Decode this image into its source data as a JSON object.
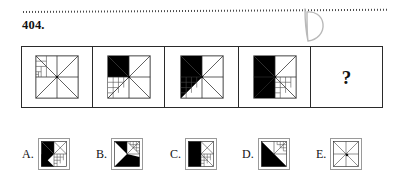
{
  "page": {
    "question_number": "404.",
    "handwritten_answer": "D",
    "divider": "dotted-rule"
  },
  "stimulus": {
    "name": "matrix-sequence",
    "cells": [
      {
        "id": "cell-1",
        "position": 1,
        "filled_sectors": [],
        "fractal_quadrant": "upper-left",
        "description": "square with full X diagonals and center cross, nested recursive grid in upper-left quadrant, no black fill"
      },
      {
        "id": "cell-2",
        "position": 2,
        "filled_sectors": [
          "upper-left-upper",
          "upper-left-lower"
        ],
        "fractal_quadrant": "lower-left",
        "description": "upper-left quadrant filled black as triangle, nested recursive grid in lower-left quadrant"
      },
      {
        "id": "cell-3",
        "position": 3,
        "filled_sectors": [
          "upper-left",
          "lower-left-upper"
        ],
        "fractal_quadrant": "lower-left",
        "description": "left half filled black forming bow-tie triangle, nested recursive grid in lower-left quadrant"
      },
      {
        "id": "cell-4",
        "position": 4,
        "filled_sectors": [
          "upper-left",
          "lower-left"
        ],
        "fractal_quadrant": "lower-right",
        "description": "large black triangle covering upper-left through lower-left, nested recursive grid in lower-right quadrant"
      },
      {
        "id": "cell-5",
        "position": 5,
        "content": "?",
        "description": "unknown answer cell containing a question mark"
      }
    ]
  },
  "options": [
    {
      "id": "option-a",
      "label": "A.",
      "description": "black triangle occupying upper-left, nested recursive grid in lower-right"
    },
    {
      "id": "option-b",
      "label": "B.",
      "description": "black region filling lower-left and bottom, nested recursive grid in upper-right"
    },
    {
      "id": "option-c",
      "label": "C.",
      "description": "solid black rectangle on left half, nested recursive grid on right half"
    },
    {
      "id": "option-d",
      "label": "D.",
      "description": "black triangle filling lower-left diagonal half, nested recursive grid in upper-right"
    },
    {
      "id": "option-e",
      "label": "E.",
      "description": "plain square with X diagonals and center cross, no black fill"
    }
  ],
  "colors": {
    "ink": "#111111",
    "fill": "#000000",
    "line": "#2a2a2a",
    "thin_line": "#6d6d6d",
    "box_border": "#9a9a9a",
    "handwriting": "#b9b9b9",
    "background": "#ffffff"
  }
}
